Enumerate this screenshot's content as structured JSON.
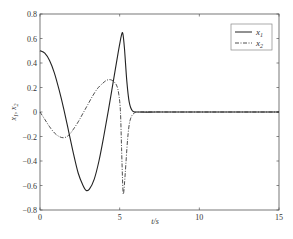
{
  "chart_data": {
    "type": "line",
    "title": "",
    "xlabel": "t/s",
    "ylabel": "x1, x2",
    "xlim": [
      0,
      15
    ],
    "ylim": [
      -0.8,
      0.8
    ],
    "x_ticks": [
      "0",
      "5",
      "10",
      "15"
    ],
    "y_ticks": [
      "0.8",
      "0.6",
      "0.4",
      "0.2",
      "0",
      "-0.2",
      "-0.4",
      "-0.6",
      "-0.8"
    ],
    "grid": false,
    "legend_position": "upper right",
    "series": [
      {
        "name": "x1",
        "style": "solid",
        "points": [
          [
            0,
            0.5
          ],
          [
            0.3,
            0.48
          ],
          [
            0.6,
            0.42
          ],
          [
            0.9,
            0.32
          ],
          [
            1.2,
            0.18
          ],
          [
            1.5,
            0.02
          ],
          [
            1.8,
            -0.16
          ],
          [
            2.1,
            -0.34
          ],
          [
            2.4,
            -0.5
          ],
          [
            2.7,
            -0.6
          ],
          [
            2.9,
            -0.64
          ],
          [
            3.1,
            -0.63
          ],
          [
            3.4,
            -0.55
          ],
          [
            3.7,
            -0.4
          ],
          [
            4.0,
            -0.2
          ],
          [
            4.3,
            0.02
          ],
          [
            4.6,
            0.25
          ],
          [
            4.9,
            0.48
          ],
          [
            5.1,
            0.62
          ],
          [
            5.2,
            0.64
          ],
          [
            5.3,
            0.52
          ],
          [
            5.45,
            0.25
          ],
          [
            5.6,
            0.08
          ],
          [
            5.8,
            0.01
          ],
          [
            6.2,
            0.0
          ],
          [
            8,
            0.0
          ],
          [
            10,
            0.0
          ],
          [
            12,
            0.0
          ],
          [
            15,
            0.0
          ]
        ]
      },
      {
        "name": "x2",
        "style": "dash-dot",
        "points": [
          [
            0,
            0.0
          ],
          [
            0.3,
            -0.06
          ],
          [
            0.6,
            -0.12
          ],
          [
            0.9,
            -0.17
          ],
          [
            1.2,
            -0.2
          ],
          [
            1.5,
            -0.21
          ],
          [
            1.8,
            -0.19
          ],
          [
            2.1,
            -0.14
          ],
          [
            2.4,
            -0.08
          ],
          [
            2.7,
            -0.01
          ],
          [
            3.0,
            0.06
          ],
          [
            3.3,
            0.13
          ],
          [
            3.6,
            0.19
          ],
          [
            3.9,
            0.23
          ],
          [
            4.2,
            0.26
          ],
          [
            4.5,
            0.26
          ],
          [
            4.8,
            0.22
          ],
          [
            4.95,
            0.14
          ],
          [
            5.05,
            0.0
          ],
          [
            5.12,
            -0.3
          ],
          [
            5.2,
            -0.62
          ],
          [
            5.25,
            -0.66
          ],
          [
            5.35,
            -0.5
          ],
          [
            5.5,
            -0.22
          ],
          [
            5.65,
            -0.07
          ],
          [
            5.9,
            -0.01
          ],
          [
            6.3,
            0.0
          ],
          [
            8,
            0.0
          ],
          [
            10,
            0.0
          ],
          [
            12,
            0.0
          ],
          [
            15,
            0.0
          ]
        ]
      }
    ]
  },
  "axes": {
    "xlabel": "t/s",
    "ylabel_main": "x",
    "ylabel_sub1": "1",
    "ylabel_sep": ", ",
    "ylabel_sub2": "2",
    "x_ticks": [
      "0",
      "5",
      "10",
      "15"
    ],
    "y_ticks": [
      "0.8",
      "0.6",
      "0.4",
      "0.2",
      "0",
      "-0.2",
      "-0.4",
      "-0.6",
      "-0.8"
    ]
  },
  "legend": {
    "items": [
      {
        "label": "x",
        "sub": "1",
        "style": "solid"
      },
      {
        "label": "x",
        "sub": "2",
        "style": "dash-dot"
      }
    ]
  },
  "colors": {
    "line": "#222222",
    "axis": "#555555",
    "legend_border": "#888888"
  }
}
